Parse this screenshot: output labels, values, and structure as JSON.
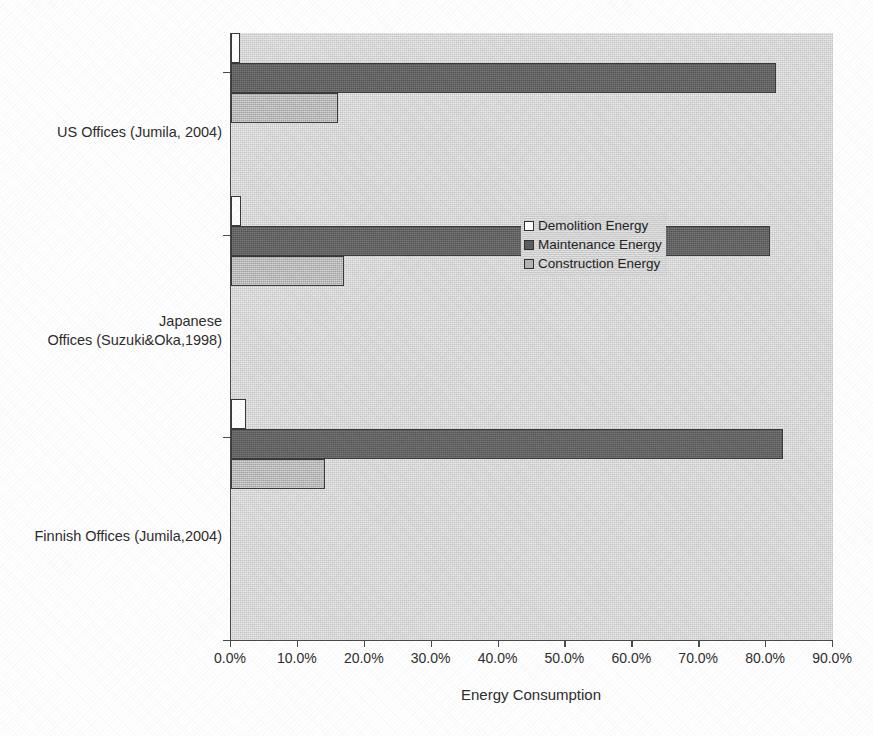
{
  "chart_data": {
    "type": "bar",
    "orientation": "horizontal",
    "title": "",
    "xlabel": "Energy Consumption",
    "ylabel": "",
    "xlim": [
      0,
      90
    ],
    "xtick_labels": [
      "0.0%",
      "10.0%",
      "20.0%",
      "30.0%",
      "40.0%",
      "50.0%",
      "60.0%",
      "70.0%",
      "80.0%",
      "90.0%"
    ],
    "xtick_values": [
      0,
      10,
      20,
      30,
      40,
      50,
      60,
      70,
      80,
      90
    ],
    "grid": false,
    "legend_position": "center-right",
    "categories": [
      "US Offices (Jumila, 2004)",
      "Japanese\nOffices (Suzuki&Oka,1998)",
      "Finnish Offices (Jumila,2004)"
    ],
    "category_labels": [
      {
        "line1": "US Offices (Jumila, 2004)",
        "line2": ""
      },
      {
        "line1": "Japanese",
        "line2": "Offices (Suzuki&Oka,1998)"
      },
      {
        "line1": "Finnish Offices (Jumila,2004)",
        "line2": ""
      }
    ],
    "series": [
      {
        "name": "Demolition Energy",
        "color": "#ffffff",
        "values": [
          1.3,
          1.5,
          2.2
        ]
      },
      {
        "name": "Maintenance Energy",
        "color": "#5e5e5e",
        "values": [
          81.5,
          80.6,
          82.5
        ]
      },
      {
        "name": "Construction Energy",
        "color": "#b4b4b4",
        "values": [
          16.0,
          16.9,
          14.0
        ]
      }
    ]
  },
  "legend": {
    "items": [
      {
        "label": "Demolition Energy",
        "swatch": "demolition"
      },
      {
        "label": "Maintenance Energy",
        "swatch": "maintenance"
      },
      {
        "label": "Construction Energy",
        "swatch": "construction"
      }
    ]
  },
  "axis": {
    "x_title": "Energy Consumption"
  },
  "colors": {
    "plot_background": "#d2d2d2",
    "axis_line": "#4a4a4a",
    "demolition": "#ffffff",
    "maintenance": "#5e5e5e",
    "construction": "#b4b4b4",
    "text": "#2e2e2e"
  }
}
